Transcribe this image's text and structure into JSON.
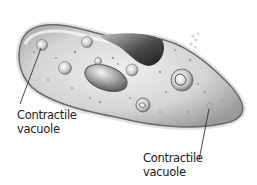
{
  "diagram": {
    "labels": [
      {
        "id": "contractile-vacuole-left",
        "line1": "Contractile",
        "line2": "vacuole"
      },
      {
        "id": "contractile-vacuole-right",
        "line1": "Contractile",
        "line2": "vacuole"
      }
    ]
  },
  "colors": {
    "background": "#ffffff",
    "cell_body": "#cfcfcf",
    "cell_outline": "#6a6a6a",
    "oral_groove": "#3a3a3a",
    "text": "#222222"
  }
}
